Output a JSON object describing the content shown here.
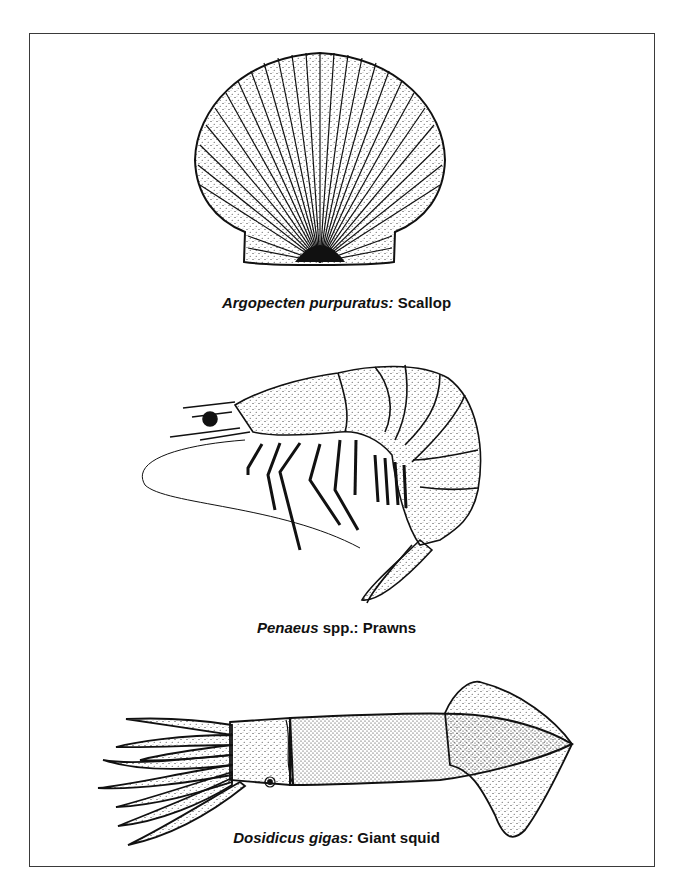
{
  "figure": {
    "panels": [
      {
        "id": "scallop",
        "scientific_name": "Argopecten purpuratus:",
        "common_name": "Scallop",
        "icon": "scallop-shell-illustration"
      },
      {
        "id": "prawn",
        "scientific_name": "Penaeus",
        "qualifier": "spp.:",
        "common_name": "Prawns",
        "icon": "prawn-illustration"
      },
      {
        "id": "squid",
        "scientific_name": "Dosidicus gigas:",
        "common_name": "Giant squid",
        "icon": "squid-illustration"
      }
    ],
    "colors": {
      "ink": "#111111",
      "border": "#3a3a3a",
      "background": "#ffffff"
    }
  }
}
